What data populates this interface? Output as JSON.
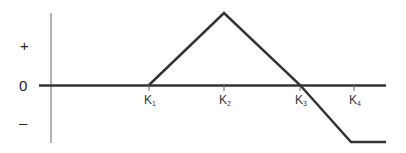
{
  "diagram": {
    "type": "payoff-diagram",
    "y_labels": {
      "plus": "+",
      "zero": "0",
      "minus": "–"
    },
    "strikes": [
      {
        "label": "K",
        "sub": "1",
        "x": 149
      },
      {
        "label": "K",
        "sub": "2",
        "x": 224
      },
      {
        "label": "K",
        "sub": "3",
        "x": 300
      },
      {
        "label": "K",
        "sub": "4",
        "x": 354
      }
    ],
    "payoff_path": [
      [
        51,
        85
      ],
      [
        149,
        85
      ],
      [
        224,
        13
      ],
      [
        300,
        85
      ],
      [
        351,
        142
      ],
      [
        386,
        142
      ]
    ],
    "colors": {
      "line": "#333333",
      "axis": "#555555"
    }
  }
}
